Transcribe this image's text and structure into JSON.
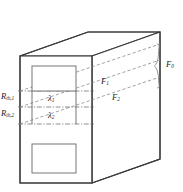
{
  "figure": {
    "type": "engineering-diagram",
    "colors": {
      "outline": "#3a3a3a",
      "inner_rect": "#6e6e6e",
      "dashed": "#8a8a8a",
      "brace": "#8a8a8a",
      "text": "#1a1a1a",
      "background": "#ffffff"
    },
    "labels": {
      "resistance_1": {
        "base": "R",
        "sub": "th,1"
      },
      "resistance_2": {
        "base": "R",
        "sub": "th,2"
      },
      "lambda_1": {
        "base": "λ",
        "sub": "1"
      },
      "lambda_2": {
        "base": "λ",
        "sub": "2"
      },
      "flux_1": {
        "base": "F",
        "sub": "1"
      },
      "flux_2": {
        "base": "F",
        "sub": "2"
      },
      "flux_0": {
        "base": "F",
        "sub": "0"
      }
    },
    "geometry": {
      "front_face": {
        "x": 20,
        "y": 56,
        "width": 72,
        "height": 127
      },
      "depth_offset": {
        "dx": 68,
        "dy": -24
      },
      "inner_rect_top": {
        "x": 32,
        "y": 66,
        "width": 44,
        "height": 25
      },
      "inner_rect_bottom": {
        "x": 32,
        "y": 144,
        "width": 44,
        "height": 29
      },
      "band_lines_y": [
        91,
        107,
        124
      ],
      "brace": {
        "x": 159,
        "y_top": 44,
        "y_bottom": 88
      }
    }
  }
}
